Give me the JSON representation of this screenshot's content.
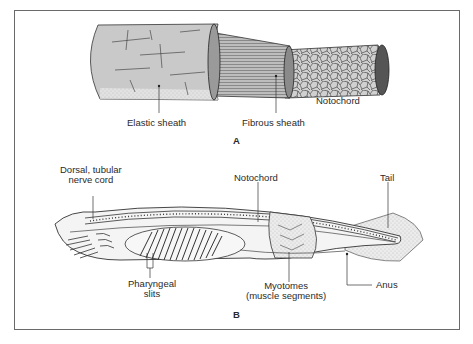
{
  "figure": {
    "panel_a": {
      "letter": "A",
      "labels": {
        "elastic_sheath": "Elastic sheath",
        "fibrous_sheath": "Fibrous sheath",
        "notochord": "Notochord"
      }
    },
    "panel_b": {
      "letter": "B",
      "labels": {
        "nerve_cord_line1": "Dorsal, tubular",
        "nerve_cord_line2": "nerve cord",
        "notochord": "Notochord",
        "tail": "Tail",
        "pharyngeal_line1": "Pharyngeal",
        "pharyngeal_line2": "slits",
        "myotomes_line1": "Myotomes",
        "myotomes_line2": "(muscle segments)",
        "anus": "Anus"
      }
    },
    "colors": {
      "frame": "#6a6a6a",
      "fill_gray": "#c9c9c9",
      "fill_light": "#e6e6e6",
      "ink": "#2a2a2a"
    }
  }
}
